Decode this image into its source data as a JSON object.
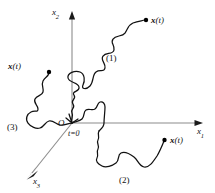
{
  "figure": {
    "background_color": "#ffffff",
    "ink_color": "#111111",
    "axis_color": "#8c8c8c"
  },
  "axes": [
    {
      "name": "x1",
      "label_main": "x",
      "label_sub": "1",
      "direction": "right"
    },
    {
      "name": "x2",
      "label_main": "x",
      "label_sub": "2",
      "direction": "up"
    },
    {
      "name": "x3",
      "label_main": "x",
      "label_sub": "3",
      "direction": "down-left"
    }
  ],
  "origin": {
    "symbol": "O",
    "time_label": "t=0"
  },
  "trajectories": [
    {
      "id": "1",
      "number_label": "(1)",
      "endpoint_label_x": "x",
      "endpoint_label_t": "(t)",
      "endpoint_label": "x(t)",
      "region": "upper-right"
    },
    {
      "id": "2",
      "number_label": "(2)",
      "endpoint_label_x": "x",
      "endpoint_label_t": "(t)",
      "endpoint_label": "x(t)",
      "region": "lower-right"
    },
    {
      "id": "3",
      "number_label": "(3)",
      "endpoint_label_x": "x",
      "endpoint_label_t": "(t)",
      "endpoint_label": "x(t)",
      "region": "left"
    }
  ]
}
